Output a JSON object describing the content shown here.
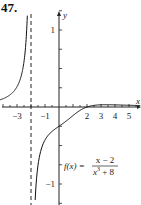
{
  "problem": {
    "number": "47."
  },
  "chart_data": {
    "type": "line",
    "title": "",
    "function_label": "f(x) = (x - 2)/(x^3 + 8)",
    "formula": {
      "lhs": "f(x) =",
      "numerator": "x − 2",
      "denominator_base": "x",
      "denominator_exp": "3",
      "denominator_rest": " + 8"
    },
    "xlabel": "x",
    "ylabel": "y",
    "x_tick_labels": [
      "-3",
      "-1",
      "2",
      "3",
      "4",
      "5"
    ],
    "x_ticks": [
      -4,
      -3,
      -2,
      -1,
      0,
      1,
      2,
      3,
      4,
      5,
      6
    ],
    "y_tick_labels": [
      "1",
      "-1"
    ],
    "xlim": [
      -4,
      6
    ],
    "ylim": [
      -1.3,
      1.6
    ],
    "vertical_asymptote": {
      "x": -2,
      "style": "dashed"
    },
    "horizontal_asymptote": {
      "y": 0
    },
    "grid": false,
    "series": [
      {
        "name": "left branch (x < -2)",
        "x": [
          -4.0,
          -3.5,
          -3.0,
          -2.6,
          -2.4,
          -2.3,
          -2.25
        ],
        "y": [
          0.107,
          0.157,
          0.263,
          0.583,
          1.07,
          1.64,
          2.0
        ]
      },
      {
        "name": "right branch (x > -2)",
        "x": [
          -1.8,
          -1.7,
          -1.5,
          -1.0,
          -0.5,
          0.0,
          0.5,
          1.0,
          2.0,
          3.0,
          4.0,
          5.0,
          6.0
        ],
        "y": [
          -1.47,
          -1.01,
          -0.71,
          -0.43,
          -0.32,
          -0.25,
          -0.18,
          -0.11,
          0.0,
          0.029,
          0.028,
          0.0226,
          0.018
        ]
      }
    ]
  }
}
